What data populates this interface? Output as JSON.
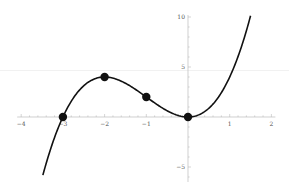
{
  "chart_data": {
    "type": "line",
    "title": "",
    "xlabel": "",
    "ylabel": "",
    "function": "y = x^3 + 3x^2",
    "xlim": [
      -4,
      2
    ],
    "ylim": [
      -6,
      10
    ],
    "grid": false,
    "legend": null,
    "x_ticks": [
      -4,
      -3,
      -2,
      -1,
      1,
      2
    ],
    "x_tick_labels": [
      "-4",
      "-3",
      "-2",
      "-1",
      "1",
      "2"
    ],
    "y_ticks": [
      -5,
      5,
      10
    ],
    "y_tick_labels": [
      "-5",
      "5",
      "10"
    ],
    "curve_domain": [
      -3.48,
      1.5
    ],
    "series": [
      {
        "name": "curve",
        "x": [
          -3.48,
          -3.25,
          -3.0,
          -2.75,
          -2.5,
          -2.25,
          -2.0,
          -1.75,
          -1.5,
          -1.25,
          -1.0,
          -0.75,
          -0.5,
          -0.25,
          0.0,
          0.25,
          0.5,
          0.75,
          1.0,
          1.25,
          1.5
        ],
        "y": [
          -5.81,
          -1.62,
          0.0,
          1.89,
          3.13,
          3.8,
          4.0,
          3.83,
          3.38,
          2.73,
          2.0,
          1.27,
          0.63,
          0.17,
          0.0,
          0.2,
          0.88,
          2.11,
          4.0,
          6.64,
          10.13
        ]
      },
      {
        "name": "marked-points",
        "type": "scatter",
        "x": [
          -3,
          -2,
          -1,
          0
        ],
        "y": [
          0,
          4,
          2,
          0
        ]
      }
    ],
    "colors": {
      "curve": "#111111",
      "points": "#111111",
      "axes": "#bbbbbb",
      "labels": "#555555"
    }
  }
}
